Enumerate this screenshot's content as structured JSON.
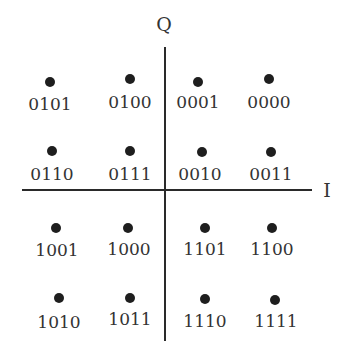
{
  "diagram": {
    "axes": {
      "vertical_label": "Q",
      "horizontal_label": "I",
      "color": "#2a2a2a"
    },
    "dot_color": "#1e1e1e",
    "label_color": "#333333",
    "points": [
      {
        "label": "0101",
        "row": 0,
        "col": 0
      },
      {
        "label": "0100",
        "row": 0,
        "col": 1
      },
      {
        "label": "0001",
        "row": 0,
        "col": 2
      },
      {
        "label": "0000",
        "row": 0,
        "col": 3
      },
      {
        "label": "0110",
        "row": 1,
        "col": 0
      },
      {
        "label": "0111",
        "row": 1,
        "col": 1
      },
      {
        "label": "0010",
        "row": 1,
        "col": 2
      },
      {
        "label": "0011",
        "row": 1,
        "col": 3
      },
      {
        "label": "1001",
        "row": 2,
        "col": 0
      },
      {
        "label": "1000",
        "row": 2,
        "col": 1
      },
      {
        "label": "1101",
        "row": 2,
        "col": 2
      },
      {
        "label": "1100",
        "row": 2,
        "col": 3
      },
      {
        "label": "1010",
        "row": 3,
        "col": 0
      },
      {
        "label": "1011",
        "row": 3,
        "col": 1
      },
      {
        "label": "1110",
        "row": 3,
        "col": 2
      },
      {
        "label": "1111",
        "row": 3,
        "col": 3
      }
    ]
  }
}
